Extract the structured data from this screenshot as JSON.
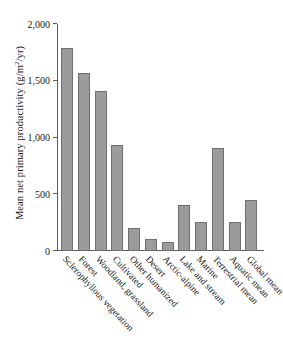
{
  "chart": {
    "ylabel_text": "Mean net primary productivity (g/m",
    "ylabel_sup": "2",
    "ylabel_tail": "/yr)",
    "bar_color": "#9a9b9b",
    "bar_border_color": "#6e6f6f",
    "axis_color": "#5c5c5c",
    "background": "#ffffff"
  },
  "chart_data": {
    "type": "bar",
    "title": "",
    "xlabel": "",
    "ylabel": "Mean net primary productivity (g/m²/yr)",
    "ylim": [
      0,
      2000
    ],
    "yticks": [
      0,
      500,
      1000,
      1500,
      2000
    ],
    "ytick_labels": [
      "0",
      "500",
      "1,000",
      "1,500",
      "2,000"
    ],
    "grid": false,
    "legend": null,
    "categories": [
      "Sclerophyllous vegetation",
      "Forest",
      "Woodland, grassland",
      "Cultivated",
      "Other humanized",
      "Desert",
      "Arctic-alpine",
      "Lake and stream",
      "Marine",
      "Terrestrial mean",
      "Aquatic mean",
      "Global mean"
    ],
    "values": [
      1790,
      1570,
      1410,
      935,
      205,
      105,
      80,
      405,
      260,
      910,
      260,
      450
    ]
  }
}
